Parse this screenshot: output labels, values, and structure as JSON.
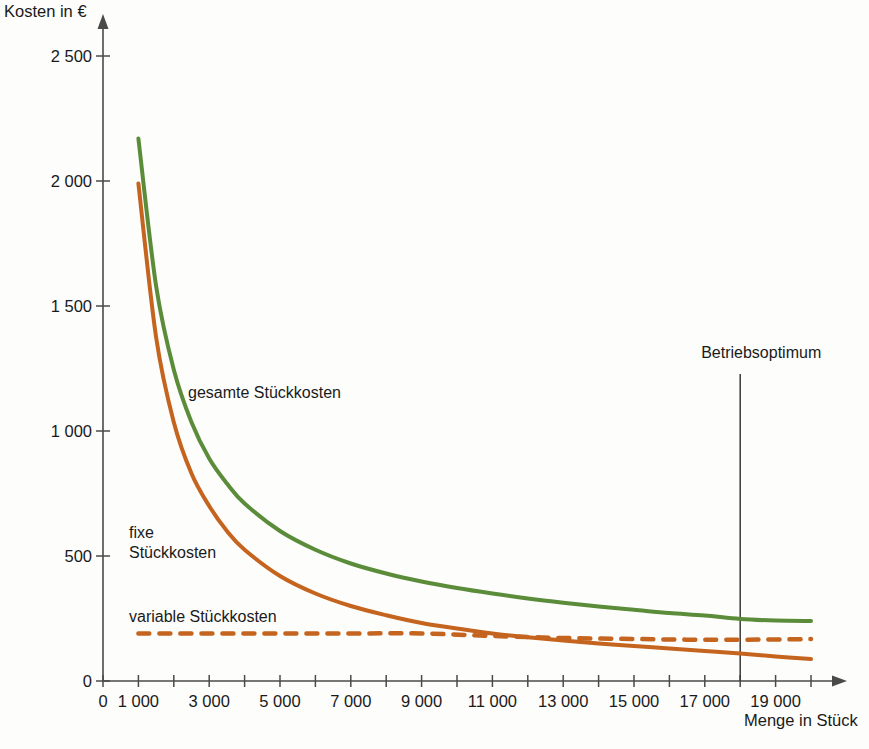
{
  "chart_data": {
    "type": "line",
    "title": "",
    "xlabel": "Menge in Stück",
    "ylabel": "Kosten in €",
    "xlim": [
      0,
      20500
    ],
    "ylim": [
      0,
      2600
    ],
    "grid": false,
    "legend_position": "inline-annotations",
    "x_ticks_major": [
      "0",
      "1 000",
      "3 000",
      "5 000",
      "7 000",
      "9 000",
      "11 000",
      "13 000",
      "15 000",
      "17 000",
      "19 000"
    ],
    "y_ticks": [
      "0",
      "500",
      "1 000",
      "1 500",
      "2 000",
      "2 500"
    ],
    "y_tick_values": [
      0,
      500,
      1000,
      1500,
      2000,
      2500
    ],
    "x_tick_values_all": [
      0,
      1000,
      2000,
      3000,
      4000,
      5000,
      6000,
      7000,
      8000,
      9000,
      10000,
      11000,
      12000,
      13000,
      14000,
      15000,
      16000,
      17000,
      18000,
      19000,
      20000
    ],
    "x_tick_labeled_values": [
      0,
      1000,
      3000,
      5000,
      7000,
      9000,
      11000,
      13000,
      15000,
      17000,
      19000
    ],
    "series": [
      {
        "name": "gesamte Stückkosten",
        "color": "#5b8c3a",
        "style": "solid",
        "x": [
          1000,
          1500,
          2000,
          2500,
          3000,
          3500,
          4000,
          5000,
          6000,
          7000,
          8000,
          9000,
          10000,
          11000,
          12000,
          13000,
          14000,
          15000,
          16000,
          17000,
          18000,
          19000,
          20000
        ],
        "y": [
          2170,
          1580,
          1245,
          1035,
          890,
          790,
          710,
          600,
          525,
          470,
          430,
          398,
          372,
          350,
          330,
          313,
          298,
          285,
          272,
          262,
          248,
          242,
          240
        ]
      },
      {
        "name": "fixe Stückkosten",
        "color": "#c4641e",
        "style": "solid",
        "x": [
          1000,
          1500,
          2000,
          2500,
          3000,
          3500,
          4000,
          5000,
          6000,
          7000,
          8000,
          9000,
          10000,
          11000,
          12000,
          13000,
          14000,
          15000,
          16000,
          17000,
          18000,
          19000,
          20000
        ],
        "y": [
          1990,
          1375,
          1035,
          830,
          700,
          600,
          525,
          420,
          350,
          300,
          263,
          232,
          210,
          190,
          175,
          162,
          150,
          140,
          130,
          120,
          110,
          98,
          88
        ]
      },
      {
        "name": "variable Stückkosten",
        "color": "#c4641e",
        "style": "dashed",
        "x": [
          1000,
          3000,
          5000,
          7000,
          9000,
          11000,
          13000,
          15000,
          17000,
          19000,
          20000
        ],
        "y": [
          190,
          190,
          190,
          190,
          190,
          180,
          172,
          168,
          165,
          166,
          168
        ]
      }
    ],
    "annotations": [
      {
        "name": "Betriebsoptimum",
        "label": "Betriebsoptimum",
        "x": 18000,
        "type": "vertical-line"
      }
    ]
  },
  "labels": {
    "y_axis_title": "Kosten in €",
    "x_axis_title": "Menge in Stück",
    "series_total": "gesamte Stückkosten",
    "series_fixed_line1": "fixe",
    "series_fixed_line2": "Stückkosten",
    "series_variable": "variable Stückkosten",
    "annotation_optimum": "Betriebsoptimum"
  },
  "colors": {
    "total": "#5b8c3a",
    "fixed": "#c4641e",
    "variable": "#c4641e",
    "axis": "#4a4a4a",
    "background": "#fdfdfb"
  }
}
